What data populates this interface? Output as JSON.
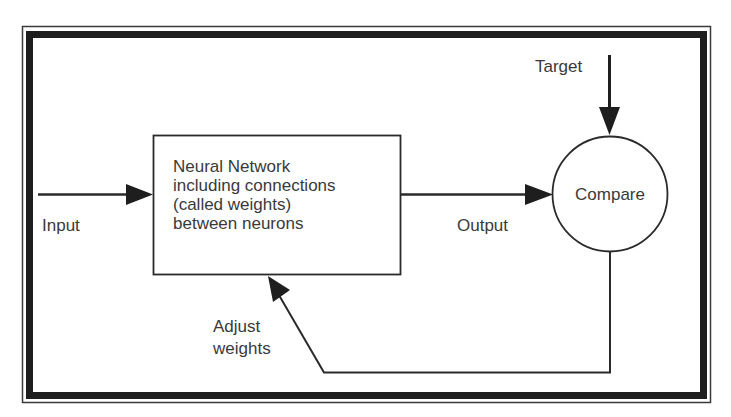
{
  "diagram": {
    "colors": {
      "stroke": "#2a2a2a",
      "text": "#3a3a3a",
      "frame": "#1e1e1e",
      "background": "#ffffff"
    },
    "nodes": {
      "network": {
        "shape": "rectangle",
        "lines": [
          "Neural Network",
          "including connections",
          "(called weights)",
          "between neurons"
        ]
      },
      "compare": {
        "shape": "circle",
        "label": "Compare"
      }
    },
    "labels": {
      "input": "Input",
      "output": "Output",
      "target": "Target",
      "adjust_line1": "Adjust",
      "adjust_line2": "weights"
    },
    "edges": [
      {
        "from": "input",
        "to": "network",
        "label": "Input"
      },
      {
        "from": "network",
        "to": "compare",
        "label": "Output"
      },
      {
        "from": "target",
        "to": "compare",
        "label": "Target"
      },
      {
        "from": "compare",
        "to": "network",
        "label": "Adjust weights"
      }
    ]
  }
}
